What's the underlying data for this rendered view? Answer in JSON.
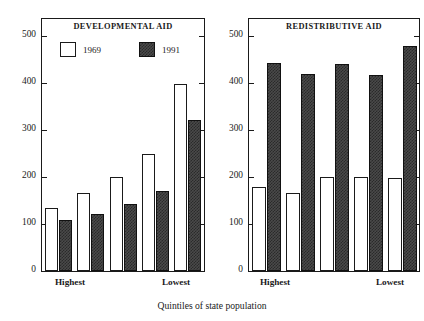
{
  "figure": {
    "xaxis_title": "Quintiles of state population",
    "legend": [
      {
        "key": "y1969",
        "label": "1969",
        "style": "open"
      },
      {
        "key": "y1991",
        "label": "1991",
        "style": "hatched"
      }
    ],
    "category_labels": {
      "first": "Highest",
      "last": "Lowest"
    },
    "colors": {
      "ink": "#1a1a1a",
      "bar_1969": "#ffffff",
      "bar_1991": "#4a4a4a"
    }
  },
  "chart_data": [
    {
      "type": "bar",
      "title": "DEVELOPMENTAL AID",
      "xlabel": "Quintiles of state population",
      "ylabel": "",
      "categories": [
        "Highest",
        "2",
        "3",
        "4",
        "Lowest"
      ],
      "yticks": [
        0,
        100,
        200,
        300,
        400,
        500
      ],
      "ylim": [
        0,
        540
      ],
      "grid": false,
      "legend_position": "top-inside",
      "series": [
        {
          "name": "1969",
          "values": [
            135,
            165,
            200,
            250,
            398
          ]
        },
        {
          "name": "1991",
          "values": [
            108,
            122,
            142,
            170,
            322
          ]
        }
      ]
    },
    {
      "type": "bar",
      "title": "REDISTRIBUTIVE AID",
      "xlabel": "Quintiles of state population",
      "ylabel": "",
      "categories": [
        "Highest",
        "2",
        "3",
        "4",
        "Lowest"
      ],
      "yticks": [
        0,
        100,
        200,
        300,
        400,
        500
      ],
      "ylim": [
        0,
        540
      ],
      "grid": false,
      "legend_position": "none",
      "series": [
        {
          "name": "1969",
          "values": [
            178,
            165,
            200,
            200,
            197
          ]
        },
        {
          "name": "1991",
          "values": [
            443,
            420,
            440,
            418,
            478
          ]
        }
      ]
    }
  ]
}
